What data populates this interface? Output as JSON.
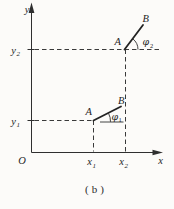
{
  "figure": {
    "type": "coordinate-diagram",
    "caption": "(b)",
    "colors": {
      "ink": "#2f2f2f",
      "paper": "#fcfbf9"
    },
    "axes": {
      "y_label": "y",
      "x_label": "x",
      "origin_label": "O"
    },
    "axis_ticks": {
      "y2": {
        "base": "y",
        "sub": "2"
      },
      "y1": {
        "base": "y",
        "sub": "1"
      },
      "x1": {
        "base": "x",
        "sub": "1"
      },
      "x2": {
        "base": "x",
        "sub": "2"
      }
    },
    "upper_vector": {
      "start_label": "A",
      "end_label": "B",
      "angle": {
        "base": "φ",
        "sub": "2"
      }
    },
    "lower_vector": {
      "start_label": "A",
      "end_label": "B",
      "angle": {
        "base": "φ",
        "sub": "1"
      }
    }
  }
}
